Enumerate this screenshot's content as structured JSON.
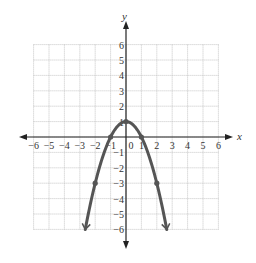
{
  "chart_data": {
    "type": "line",
    "title": "",
    "xlabel": "x",
    "ylabel": "y",
    "xlim": [
      -6,
      6
    ],
    "ylim": [
      -6,
      6
    ],
    "grid": true,
    "x_ticks": [
      "-6",
      "-5",
      "-4",
      "-3",
      "-2",
      "-1",
      "0",
      "1",
      "2",
      "3",
      "4",
      "5",
      "6"
    ],
    "y_ticks": [
      "6",
      "5",
      "4",
      "3",
      "2",
      "1",
      "-1",
      "-2",
      "-3",
      "-4",
      "-5",
      "-6"
    ],
    "series": [
      {
        "name": "y = 1 - x^2",
        "function": "1 - x^2",
        "x": [
          -2.646,
          -2,
          -1,
          0,
          1,
          2,
          2.646
        ],
        "y": [
          -6,
          -3,
          0,
          1,
          0,
          -3,
          -6
        ],
        "marked_points": [
          [
            -2,
            -3
          ],
          [
            -1,
            0
          ],
          [
            0,
            1
          ],
          [
            1,
            0
          ],
          [
            2,
            -3
          ]
        ],
        "arrows_at_ends": true
      }
    ]
  },
  "colors": {
    "curve": "#555555",
    "axis": "#222222",
    "grid": "#b8b8b8",
    "text": "#333333"
  }
}
